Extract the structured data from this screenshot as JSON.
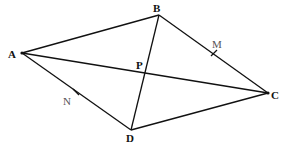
{
  "figure": {
    "type": "quadrilateral",
    "points": {
      "A": {
        "label": "A",
        "x": 22,
        "y": 53
      },
      "B": {
        "label": "B",
        "x": 159,
        "y": 15
      },
      "C": {
        "label": "C",
        "x": 268,
        "y": 93
      },
      "D": {
        "label": "D",
        "x": 131,
        "y": 130
      },
      "P": {
        "label": "P",
        "x": 143,
        "y": 73
      },
      "M": {
        "label": "M",
        "x": 214,
        "y": 53
      },
      "N": {
        "label": "N",
        "x": 76,
        "y": 92
      }
    },
    "segments": [
      "AB",
      "BC",
      "CD",
      "DA",
      "AC",
      "BD"
    ],
    "line_color": "#111111"
  }
}
